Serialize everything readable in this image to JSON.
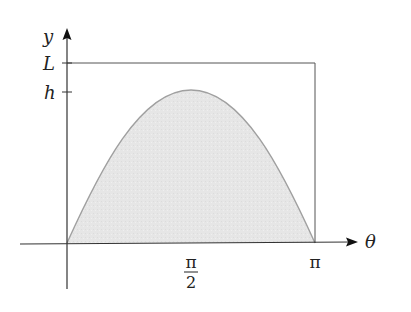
{
  "diagram": {
    "type": "area-under-curve",
    "axes": {
      "x_label": "θ",
      "y_label": "y",
      "x_ticks": [
        {
          "label_num": "π",
          "label_den": "2",
          "position": "pi/2"
        },
        {
          "label": "π",
          "position": "pi"
        }
      ],
      "y_ticks": [
        {
          "label": "L",
          "position": "L"
        },
        {
          "label": "h",
          "position": "h"
        }
      ]
    },
    "curve": {
      "function": "y = h sin(θ)",
      "domain": [
        0,
        "π"
      ],
      "peak": {
        "x": "π/2",
        "y": "h"
      },
      "fill_color": "#e6e6e6",
      "stroke_color": "#a0a0a0"
    },
    "rectangle": {
      "x_range": [
        0,
        "π"
      ],
      "y_range": [
        0,
        "L"
      ],
      "stroke_color": "#555555"
    },
    "colors": {
      "axis": "#333333",
      "shading": "#e6e6e6"
    }
  }
}
